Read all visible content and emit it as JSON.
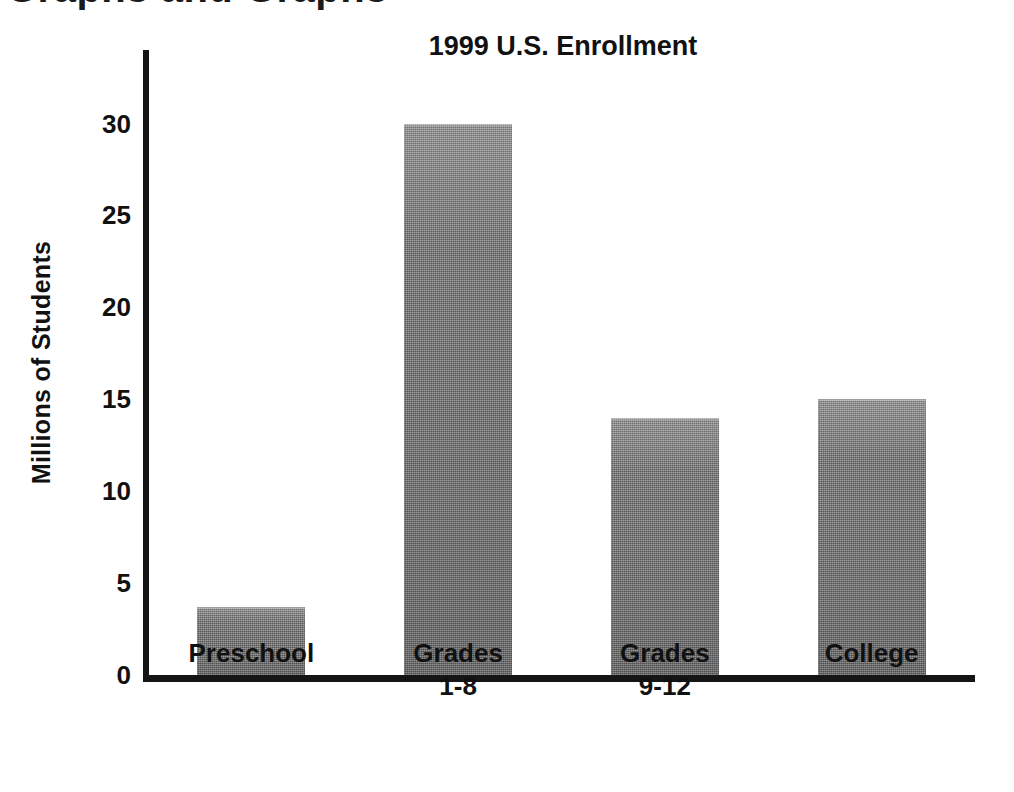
{
  "clipped_heading": "Graphs and Graphs",
  "chart_data": {
    "type": "bar",
    "title": "1999 U.S. Enrollment",
    "xlabel": "",
    "ylabel": "Millions of Students",
    "categories": [
      "Preschool",
      "Grades\n1-8",
      "Grades\n9-12",
      "College"
    ],
    "values": [
      3.7,
      30,
      14,
      15
    ],
    "ylim": [
      0,
      34
    ],
    "yticks": [
      0,
      5,
      10,
      15,
      20,
      25,
      30
    ],
    "ytick_labels": [
      "0",
      "5",
      "10",
      "15",
      "20",
      "25",
      "30"
    ],
    "grid": false,
    "legend": null,
    "bar_color": "#7b7b7b",
    "axis_color": "#151515",
    "text_color": "#111111",
    "background": "#ffffff"
  }
}
